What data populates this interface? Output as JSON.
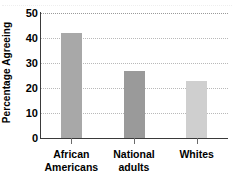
{
  "chart_data": {
    "type": "bar",
    "title": "",
    "subtitle": "",
    "xlabel": "",
    "ylabel": "Percentage Agreeing",
    "categories": [
      "African Americans",
      "National adults",
      "Whites"
    ],
    "category_lines": [
      [
        "African",
        "Americans"
      ],
      [
        "National",
        "adults"
      ],
      [
        "Whites"
      ]
    ],
    "values": [
      42,
      27,
      23
    ],
    "ylim": [
      0,
      50
    ],
    "yticks": [
      0,
      10,
      20,
      30,
      40,
      50
    ],
    "ytick_labels": [
      "0",
      "10",
      "20",
      "30",
      "40",
      "50"
    ],
    "grid": true,
    "grid_axis": "y",
    "grid_style": "dotted",
    "legend": false,
    "legend_position": "none",
    "bar_colors": [
      "#a8a8a8",
      "#9a9a9a",
      "#cfcfcf"
    ],
    "annotations": []
  },
  "style": {
    "background": "#ffffff",
    "axis_color": "#3a3a3a",
    "grid_color": "#b9b9b9",
    "tick_color": "#6b6b6b",
    "text_color": "#000000"
  }
}
